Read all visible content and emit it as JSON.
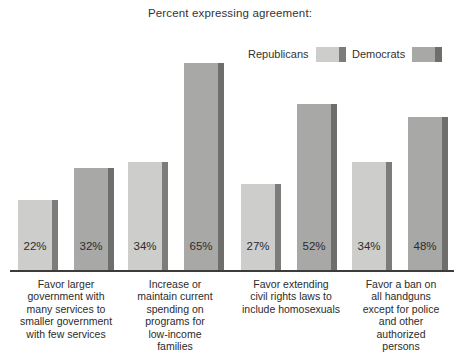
{
  "chart_data": {
    "type": "bar",
    "title": "Percent expressing agreement:",
    "xlabel": "",
    "ylabel": "",
    "ylim": [
      0,
      70
    ],
    "grid": false,
    "legend_position": "top-right",
    "orientation": "vertical",
    "grouped": true,
    "categories": [
      "Favor larger government with many services to smaller government with few services",
      "Increase or maintain current spending on programs for low-income families",
      "Favor extending civil rights laws to include homosexuals",
      "Favor a ban on all handguns except for police and other authorized persons"
    ],
    "category_lines": [
      [
        "Favor larger",
        "government with",
        "many services to",
        "smaller government",
        "with few services"
      ],
      [
        "Increase or",
        "maintain current",
        "spending on",
        "programs for",
        "low-income",
        "families"
      ],
      [
        "Favor extending",
        "civil rights laws to",
        "include homosexuals"
      ],
      [
        "Favor a ban on",
        "all handguns",
        "except for police",
        "and other",
        "authorized",
        "persons"
      ]
    ],
    "series": [
      {
        "name": "Republicans",
        "color": "#cdcdcb",
        "side_color": "#7c7c7a",
        "values": [
          22,
          34,
          27,
          34
        ],
        "labels": [
          "22%",
          "34%",
          "27%",
          "34%"
        ]
      },
      {
        "name": "Democrats",
        "color": "#a8a8a6",
        "side_color": "#6e6e6c",
        "values": [
          32,
          65,
          52,
          48
        ],
        "labels": [
          "32%",
          "65%",
          "52%",
          "48%"
        ]
      }
    ]
  },
  "legend": {
    "republicans_label": "Republicans",
    "democrats_label": "Democrats"
  },
  "colors": {
    "republican_face": "#cdcdcb",
    "republican_side": "#7c7c7a",
    "democrat_face": "#a8a8a6",
    "democrat_side": "#6e6e6c",
    "axis": "#3c3c3c",
    "text": "#2b2b2b",
    "background": "#ffffff"
  }
}
